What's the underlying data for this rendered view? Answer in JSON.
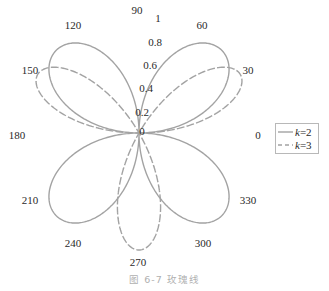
{
  "caption": "图 6-7  玫瑰线",
  "chart_data": {
    "type": "line",
    "subtype": "polar",
    "title": "",
    "caption": "图 6-7 玫瑰线",
    "theta_unit": "degrees",
    "theta_ticks": [
      0,
      30,
      60,
      90,
      120,
      150,
      180,
      210,
      240,
      270,
      300,
      330
    ],
    "r_ticks": [
      "0",
      "0.2",
      "0.4",
      "0.6",
      "0.8",
      "1"
    ],
    "rlim": [
      0,
      1
    ],
    "grid": false,
    "legend_position": "right",
    "series": [
      {
        "name": "k=2",
        "equation": "r = sin(2θ)",
        "style": "solid",
        "color": "#a0a0a0",
        "petals": 4,
        "petal_angles_deg": [
          45,
          135,
          225,
          315
        ],
        "max_r": 1
      },
      {
        "name": "k=3",
        "equation": "r = sin(3θ)",
        "style": "dashed",
        "color": "#a0a0a0",
        "petals": 3,
        "petal_angles_deg": [
          30,
          150,
          270
        ],
        "max_r": 1
      }
    ]
  },
  "legend": {
    "items": [
      {
        "label_k": "k",
        "label_rest": "=2",
        "style": "solid"
      },
      {
        "label_k": "k",
        "label_rest": "=3",
        "style": "dashed"
      }
    ]
  },
  "theta_labels": [
    {
      "text": "90",
      "x": 137,
      "y": 14
    },
    {
      "text": "60",
      "x": 202,
      "y": 29
    },
    {
      "text": "30",
      "x": 248,
      "y": 74
    },
    {
      "text": "0",
      "x": 258,
      "y": 139
    },
    {
      "text": "330",
      "x": 248,
      "y": 204
    },
    {
      "text": "300",
      "x": 203,
      "y": 247
    },
    {
      "text": "270",
      "x": 138,
      "y": 266
    },
    {
      "text": "240",
      "x": 73,
      "y": 247
    },
    {
      "text": "210",
      "x": 30,
      "y": 204
    },
    {
      "text": "180",
      "x": 17,
      "y": 139
    },
    {
      "text": "150",
      "x": 30,
      "y": 74
    },
    {
      "text": "120",
      "x": 73,
      "y": 29
    }
  ],
  "r_labels": [
    {
      "text": "1",
      "x": 158,
      "y": 22
    },
    {
      "text": "0.8",
      "x": 155,
      "y": 46
    },
    {
      "text": "0.6",
      "x": 150,
      "y": 69
    },
    {
      "text": "0.4",
      "x": 146,
      "y": 92
    },
    {
      "text": "0.2",
      "x": 142,
      "y": 116
    },
    {
      "text": "0",
      "x": 142,
      "y": 135
    }
  ]
}
